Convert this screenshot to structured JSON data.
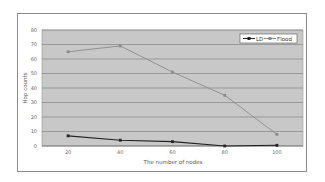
{
  "chart_data": {
    "type": "line",
    "title": "",
    "xlabel": "The number of nodes",
    "ylabel": "Hop counts",
    "categories": [
      "20",
      "40",
      "60",
      "80",
      "100"
    ],
    "x": [
      20,
      40,
      60,
      80,
      100
    ],
    "series": [
      {
        "name": "LD",
        "values": [
          7,
          4,
          3,
          0,
          0.5
        ],
        "color": "#222222",
        "marker": "diamond"
      },
      {
        "name": "Flood",
        "values": [
          65,
          69,
          51,
          35,
          8
        ],
        "color": "#8a8a8a",
        "marker": "square"
      }
    ],
    "ylim": [
      0,
      80
    ],
    "yticks": [
      0,
      10,
      20,
      30,
      40,
      50,
      60,
      70,
      80
    ],
    "grid": true,
    "legend_position": "top-right",
    "plot_background": "#c8c8c8"
  },
  "labels": {
    "xlabel": "The number of nodes",
    "ylabel": "Hop counts",
    "legend_ld": "LD",
    "legend_flood": "Flood"
  }
}
